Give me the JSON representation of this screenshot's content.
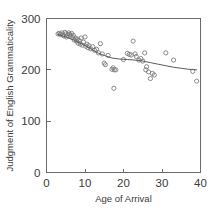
{
  "chart_data": {
    "type": "scatter",
    "title": "",
    "xlabel": "Age of Arrival",
    "ylabel": "Judgment of English Grammaticality",
    "xlim": [
      0,
      40
    ],
    "ylim": [
      0,
      300
    ],
    "xticks": [
      0,
      10,
      20,
      30,
      40
    ],
    "yticks": [
      0,
      100,
      200,
      300
    ],
    "xtick_labels": [
      "0",
      "10",
      "20",
      "30",
      "40"
    ],
    "ytick_labels": [
      "0",
      "100",
      "200",
      "300"
    ],
    "grid": false,
    "legend": null,
    "legend_position": "none",
    "marker": "open-circle",
    "series": [
      {
        "name": "Grammaticality judgment score",
        "points": [
          [
            3.0,
            270
          ],
          [
            3.3,
            271
          ],
          [
            3.6,
            269
          ],
          [
            4.0,
            272
          ],
          [
            4.2,
            268
          ],
          [
            4.5,
            266
          ],
          [
            4.8,
            273
          ],
          [
            5.0,
            270
          ],
          [
            5.2,
            264
          ],
          [
            5.5,
            268
          ],
          [
            5.8,
            272
          ],
          [
            6.0,
            269
          ],
          [
            6.2,
            266
          ],
          [
            6.5,
            271
          ],
          [
            6.8,
            263
          ],
          [
            7.0,
            267
          ],
          [
            7.2,
            258
          ],
          [
            7.5,
            262
          ],
          [
            7.8,
            256
          ],
          [
            8.0,
            260
          ],
          [
            8.2,
            252
          ],
          [
            8.5,
            257
          ],
          [
            8.8,
            250
          ],
          [
            9.0,
            262
          ],
          [
            9.3,
            248
          ],
          [
            9.6,
            254
          ],
          [
            10.0,
            264
          ],
          [
            10.2,
            246
          ],
          [
            10.5,
            250
          ],
          [
            10.8,
            243
          ],
          [
            11.0,
            247
          ],
          [
            11.5,
            241
          ],
          [
            12.0,
            245
          ],
          [
            12.5,
            238
          ],
          [
            13.0,
            240
          ],
          [
            13.5,
            233
          ],
          [
            14.0,
            251
          ],
          [
            14.5,
            231
          ],
          [
            15.0,
            213
          ],
          [
            15.3,
            210
          ],
          [
            16.0,
            228
          ],
          [
            17.0,
            201
          ],
          [
            17.3,
            204
          ],
          [
            17.6,
            200
          ],
          [
            17.5,
            164
          ],
          [
            18.0,
            200
          ],
          [
            20.0,
            220
          ],
          [
            21.0,
            232
          ],
          [
            21.5,
            230
          ],
          [
            22.0,
            229
          ],
          [
            22.5,
            256
          ],
          [
            23.0,
            231
          ],
          [
            23.3,
            226
          ],
          [
            24.0,
            219
          ],
          [
            24.5,
            222
          ],
          [
            25.0,
            217
          ],
          [
            25.5,
            233
          ],
          [
            25.8,
            200
          ],
          [
            26.0,
            206
          ],
          [
            26.5,
            196
          ],
          [
            27.0,
            183
          ],
          [
            27.5,
            193
          ],
          [
            28.0,
            190
          ],
          [
            31.0,
            233
          ],
          [
            33.0,
            219
          ],
          [
            38.0,
            197
          ],
          [
            39.0,
            178
          ]
        ]
      }
    ],
    "fit_curve": {
      "name": "fitted trend",
      "points": [
        [
          3.0,
          269
        ],
        [
          5.0,
          264
        ],
        [
          7.0,
          258
        ],
        [
          9.0,
          251
        ],
        [
          11.0,
          243
        ],
        [
          13.0,
          234
        ],
        [
          15.0,
          228
        ],
        [
          17.0,
          223
        ],
        [
          19.0,
          221
        ],
        [
          21.0,
          220
        ],
        [
          23.0,
          219
        ],
        [
          25.0,
          217
        ],
        [
          27.0,
          214
        ],
        [
          29.0,
          211
        ],
        [
          31.0,
          208
        ],
        [
          33.0,
          205
        ],
        [
          35.0,
          203
        ],
        [
          37.0,
          201
        ],
        [
          39.0,
          200
        ]
      ]
    }
  },
  "colors": {
    "axis": "#6b6b6b",
    "text": "#3b3b3b",
    "marker_stroke": "#777777",
    "fit_line": "#5c5c5c",
    "background": "#ffffff"
  }
}
